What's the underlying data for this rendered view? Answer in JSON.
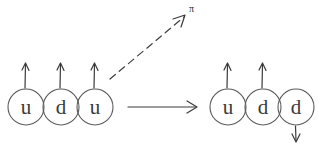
{
  "diagram": {
    "background_color": "#ffffff",
    "ink_color": "#3a3a3a",
    "circle_color": "#5a5a5a",
    "width": 318,
    "height": 145,
    "left_group": {
      "name": "initial-baryon",
      "quarks": [
        {
          "label": "u",
          "spin": "up",
          "spin_glyph": "↑",
          "cx": 26,
          "cy": 107,
          "r": 18
        },
        {
          "label": "d",
          "spin": "up",
          "spin_glyph": "↑",
          "cx": 61,
          "cy": 107,
          "r": 18
        },
        {
          "label": "u",
          "spin": "up",
          "spin_glyph": "↑",
          "cx": 95,
          "cy": 107,
          "r": 18
        }
      ]
    },
    "right_group": {
      "name": "final-baryon",
      "quarks": [
        {
          "label": "u",
          "spin": "up",
          "spin_glyph": "↑",
          "cx": 228,
          "cy": 107,
          "r": 18
        },
        {
          "label": "d",
          "spin": "up",
          "spin_glyph": "↑",
          "cx": 263,
          "cy": 107,
          "r": 18
        },
        {
          "label": "d",
          "spin": "down",
          "spin_glyph": "↓",
          "cx": 296,
          "cy": 107,
          "r": 18
        }
      ]
    },
    "transition_arrow": {
      "name": "transition-arrow",
      "style": "solid",
      "direction": "right",
      "x1": 128,
      "y1": 107,
      "x2": 196,
      "y2": 107
    },
    "emission_arrow": {
      "name": "pion-emission-arrow",
      "style": "dashed",
      "direction": "up-right",
      "x1": 110,
      "y1": 79,
      "x2": 185,
      "y2": 16,
      "label": "π",
      "label_x": 190,
      "label_y": 11
    }
  }
}
